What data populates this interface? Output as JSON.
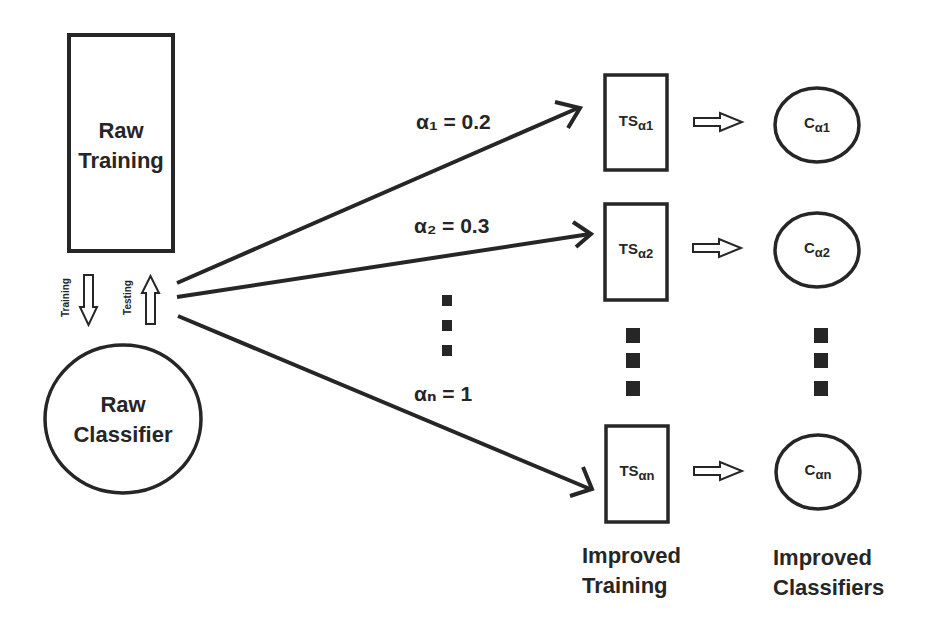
{
  "diagram": {
    "raw_training": {
      "line1": "Raw",
      "line2": "Training"
    },
    "raw_classifier": {
      "line1": "Raw",
      "line2": "Classifier"
    },
    "flow_labels": {
      "training": "Training",
      "testing": "Testing"
    },
    "alphas": [
      {
        "label": "α₁ = 0.2"
      },
      {
        "label": "α₂ = 0.3"
      },
      {
        "label": "αₙ = 1"
      }
    ],
    "training_sets": [
      {
        "base": "TS",
        "sub": "α1"
      },
      {
        "base": "TS",
        "sub": "α2"
      },
      {
        "base": "TS",
        "sub": "αn"
      }
    ],
    "classifiers": [
      {
        "base": "C",
        "sub": "α1"
      },
      {
        "base": "C",
        "sub": "α2"
      },
      {
        "base": "C",
        "sub": "αn"
      }
    ],
    "column_labels": {
      "improved_training": {
        "line1": "Improved",
        "line2": "Training"
      },
      "improved_classifiers": {
        "line1": "Improved",
        "line2": "Classifiers"
      }
    },
    "stroke_color": "#262626"
  }
}
